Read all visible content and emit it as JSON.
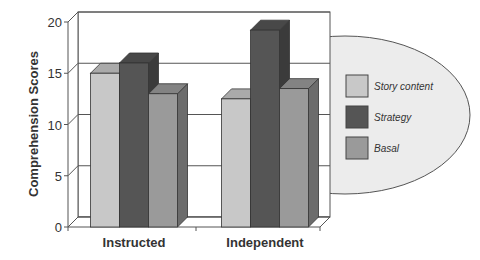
{
  "chart_data": {
    "type": "bar",
    "title": "",
    "xlabel": "",
    "ylabel": "Comprehension Scores",
    "ylim": [
      0,
      20
    ],
    "yticks": [
      0,
      5,
      10,
      15,
      20
    ],
    "grid": true,
    "style": "3d-clustered-column",
    "legend_position": "right (inside ellipse)",
    "categories": [
      "Instructed",
      "Independent"
    ],
    "series": [
      {
        "name": "Story content",
        "values": [
          15,
          12.5
        ],
        "color": "#c8c8c8"
      },
      {
        "name": "Strategy",
        "values": [
          16,
          19.2
        ],
        "color": "#555555"
      },
      {
        "name": "Basal",
        "values": [
          13,
          13.5
        ],
        "color": "#9a9a9a"
      }
    ]
  },
  "legend": {
    "items": [
      {
        "label": "Story content",
        "color": "#c8c8c8"
      },
      {
        "label": "Strategy",
        "color": "#555555"
      },
      {
        "label": "Basal",
        "color": "#9a9a9a"
      }
    ]
  }
}
